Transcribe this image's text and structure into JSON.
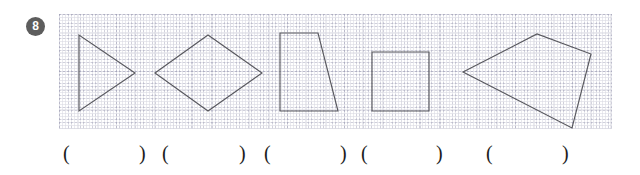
{
  "worksheet": {
    "question_number": "8",
    "grid": {
      "cell_size_px": 19,
      "line_color": "#9a9aae",
      "background": "#ffffff",
      "style": "dotted",
      "width_px": 553,
      "height_px": 115
    },
    "shape_stroke_color": "#58585e",
    "badge_color": "#5d5d5d",
    "badge_text_color": "#ffffff"
  },
  "shapes": [
    {
      "id": "shape-1",
      "name": "triangle",
      "sides": 3,
      "points": "20,21 20,97 76,59"
    },
    {
      "id": "shape-2",
      "name": "rhombus",
      "sides": 4,
      "points": "96,59 149,21 203,59 149,97"
    },
    {
      "id": "shape-3",
      "name": "trapezoid",
      "sides": 4,
      "points": "221,19 259,19 279,97 221,97"
    },
    {
      "id": "shape-4",
      "name": "square",
      "sides": 4,
      "points": "313,38 370,38 370,97 313,97"
    },
    {
      "id": "shape-5",
      "name": "quadrilateral",
      "sides": 4,
      "points": "404,58 478,20 532,40 513,114"
    }
  ],
  "answers": [
    {
      "id": "answer-1",
      "open": "(",
      "close": ")",
      "open_x": 63,
      "close_x": 139,
      "value": ""
    },
    {
      "id": "answer-2",
      "open": "(",
      "close": ")",
      "open_x": 162,
      "close_x": 239,
      "value": ""
    },
    {
      "id": "answer-3",
      "open": "(",
      "close": ")",
      "open_x": 264,
      "close_x": 340,
      "value": ""
    },
    {
      "id": "answer-4",
      "open": "(",
      "close": ")",
      "open_x": 361,
      "close_x": 436,
      "value": ""
    },
    {
      "id": "answer-5",
      "open": "(",
      "close": ")",
      "open_x": 486,
      "close_x": 562,
      "value": ""
    }
  ]
}
